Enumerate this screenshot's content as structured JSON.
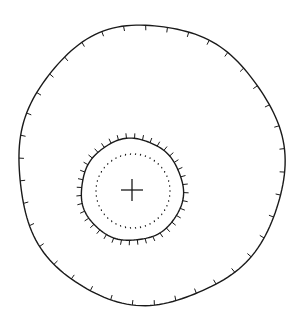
{
  "diagram": {
    "type": "hachured-contour-symbol",
    "background": "#ffffff",
    "stroke": "#1a1a1a",
    "outer_contour": {
      "cx": 150,
      "cy": 165,
      "rx": 133,
      "ry": 140,
      "tick_direction": "inward",
      "tick_count": 38,
      "tick_length": 5
    },
    "inner_contour": {
      "cx": 132,
      "cy": 190,
      "rx": 51,
      "ry": 51,
      "tick_direction": "outward",
      "tick_count": 40,
      "tick_length": 5
    },
    "dotted_circle": {
      "cx": 133,
      "cy": 191,
      "r": 37,
      "dot_count": 46
    },
    "center_marker": {
      "symbol": "cross",
      "x": 132,
      "y": 190,
      "size": 11
    }
  }
}
